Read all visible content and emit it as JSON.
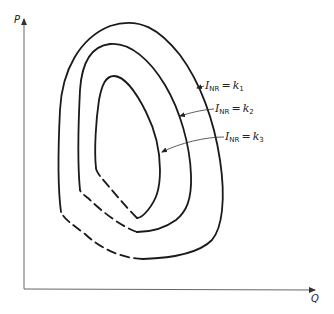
{
  "diagram": {
    "type": "contour-plot",
    "axes": {
      "y_label": "P",
      "x_label": "Q"
    },
    "contours": [
      {
        "id": "outer",
        "label_var": "I",
        "label_sub": "NR",
        "label_eq": "=",
        "label_const": "k",
        "label_const_sub": "1",
        "line_style": "solid-with-dashed-lower-left"
      },
      {
        "id": "middle",
        "label_var": "I",
        "label_sub": "NR",
        "label_eq": "=",
        "label_const": "k",
        "label_const_sub": "2",
        "line_style": "solid-with-dashed-lower-left"
      },
      {
        "id": "inner",
        "label_var": "I",
        "label_sub": "NR",
        "label_eq": "=",
        "label_const": "k",
        "label_const_sub": "3",
        "line_style": "solid-with-dashed-lower-left"
      }
    ],
    "colors": {
      "line": "#1a1a1a",
      "axis": "#555555",
      "background": "#ffffff"
    }
  }
}
